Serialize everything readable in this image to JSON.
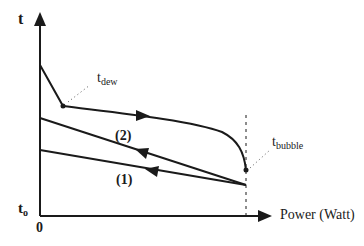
{
  "axes": {
    "y_label": "t",
    "x_label": "Power (Watt)",
    "origin_label": "0",
    "y_baseline_label": "t",
    "y_baseline_sub": "o"
  },
  "annotations": {
    "dew": {
      "main": "t",
      "sub": "dew"
    },
    "bubble": {
      "main": "t",
      "sub": "bubble"
    }
  },
  "curves": [
    {
      "id": "top",
      "label": "",
      "direction": "right"
    },
    {
      "id": "2",
      "label": "(2)",
      "direction": "left"
    },
    {
      "id": "1",
      "label": "(1)",
      "direction": "left"
    }
  ],
  "colors": {
    "ink": "#1a1a1a",
    "background": "#ffffff"
  }
}
